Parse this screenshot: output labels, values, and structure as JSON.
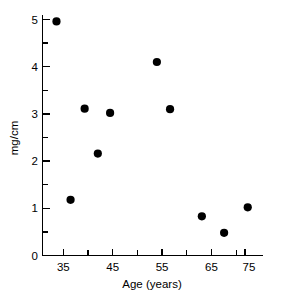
{
  "chart_data": {
    "type": "scatter",
    "title": "",
    "xlabel": "Age (years)",
    "ylabel": "mg/cm",
    "xlim": [
      28.8,
      79.8
    ],
    "ylim": [
      0,
      5.45
    ],
    "grid": false,
    "legend": null,
    "x_major_ticks": [
      35,
      45,
      55,
      65,
      75
    ],
    "x_minor_ticks": [
      40,
      50,
      60,
      70
    ],
    "x_tick_labels": [
      "35",
      "45",
      "55",
      "65",
      "75"
    ],
    "y_major_ticks": [
      0,
      1,
      2,
      3,
      4,
      5
    ],
    "y_minor_ticks": [
      0.5,
      1.5,
      2.5,
      3.5,
      4.5
    ],
    "y_tick_labels": [
      "0",
      "1",
      "2",
      "3",
      "4",
      "5"
    ],
    "marker": "filled-circle",
    "marker_color": "#000000",
    "marker_size": 5,
    "points": [
      {
        "x": 33.5,
        "y": 4.96
      },
      {
        "x": 36.6,
        "y": 1.18
      },
      {
        "x": 39.7,
        "y": 3.11
      },
      {
        "x": 42.6,
        "y": 2.16
      },
      {
        "x": 45.3,
        "y": 3.02
      },
      {
        "x": 55.6,
        "y": 4.1
      },
      {
        "x": 58.5,
        "y": 3.1
      },
      {
        "x": 65.5,
        "y": 0.83
      },
      {
        "x": 70.4,
        "y": 0.48
      },
      {
        "x": 75.6,
        "y": 1.02
      }
    ],
    "x": [
      33.5,
      36.6,
      39.7,
      42.6,
      45.3,
      55.6,
      58.5,
      65.5,
      70.4,
      75.6
    ],
    "values": [
      4.96,
      1.18,
      3.11,
      2.16,
      3.02,
      4.1,
      3.1,
      0.83,
      0.48,
      1.02
    ]
  },
  "axes": {
    "x_title": "Age (years)",
    "y_title": "mg/cm"
  },
  "ticks": {
    "x": [
      "35",
      "45",
      "55",
      "65",
      "75"
    ],
    "y": [
      "0",
      "1",
      "2",
      "3",
      "4",
      "5"
    ]
  }
}
